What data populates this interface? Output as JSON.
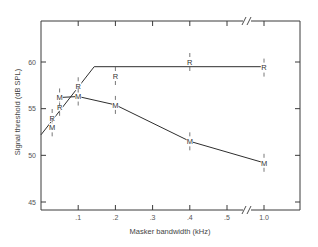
{
  "chart_data": {
    "type": "line",
    "title": "",
    "xlabel": "Masker bandwidth (kHz)",
    "ylabel": "Signal threshold (dB SPL)",
    "ylim": [
      44,
      64
    ],
    "y_ticks": [
      45,
      50,
      55,
      60
    ],
    "x_ticks": [
      {
        "value": 0.1,
        "label": ".1"
      },
      {
        "value": 0.2,
        "label": ".2"
      },
      {
        "value": 0.3,
        "label": ".3"
      },
      {
        "value": 0.4,
        "label": ".4"
      },
      {
        "value": 0.5,
        "label": ".5"
      },
      {
        "value": 1.0,
        "label": "1.0"
      }
    ],
    "axis_break": "between .5 and 1.0 (//)",
    "grid": false,
    "legend": "none (points labeled M and R)",
    "series": [
      {
        "name": "R",
        "marker": "R",
        "points": [
          {
            "x": 0.03,
            "y": 54.0
          },
          {
            "x": 0.05,
            "y": 55.2
          },
          {
            "x": 0.1,
            "y": 57.4
          },
          {
            "x": 0.2,
            "y": 58.5
          },
          {
            "x": 0.4,
            "y": 60.0
          },
          {
            "x": 1.0,
            "y": 59.4
          }
        ],
        "fit_line": [
          {
            "x": 0.0,
            "y": 52.2
          },
          {
            "x": 0.143,
            "y": 59.5
          },
          {
            "x": 1.0,
            "y": 59.5
          }
        ]
      },
      {
        "name": "M",
        "marker": "M",
        "points": [
          {
            "x": 0.03,
            "y": 53.0
          },
          {
            "x": 0.05,
            "y": 56.2
          },
          {
            "x": 0.1,
            "y": 56.3
          },
          {
            "x": 0.2,
            "y": 55.4
          },
          {
            "x": 0.4,
            "y": 51.5
          },
          {
            "x": 1.0,
            "y": 49.2
          }
        ],
        "fit_line": [
          {
            "x": 0.05,
            "y": 56.2
          },
          {
            "x": 0.1,
            "y": 56.3
          },
          {
            "x": 0.2,
            "y": 55.4
          },
          {
            "x": 0.4,
            "y": 51.5
          },
          {
            "x": 1.0,
            "y": 49.2
          }
        ]
      }
    ]
  }
}
